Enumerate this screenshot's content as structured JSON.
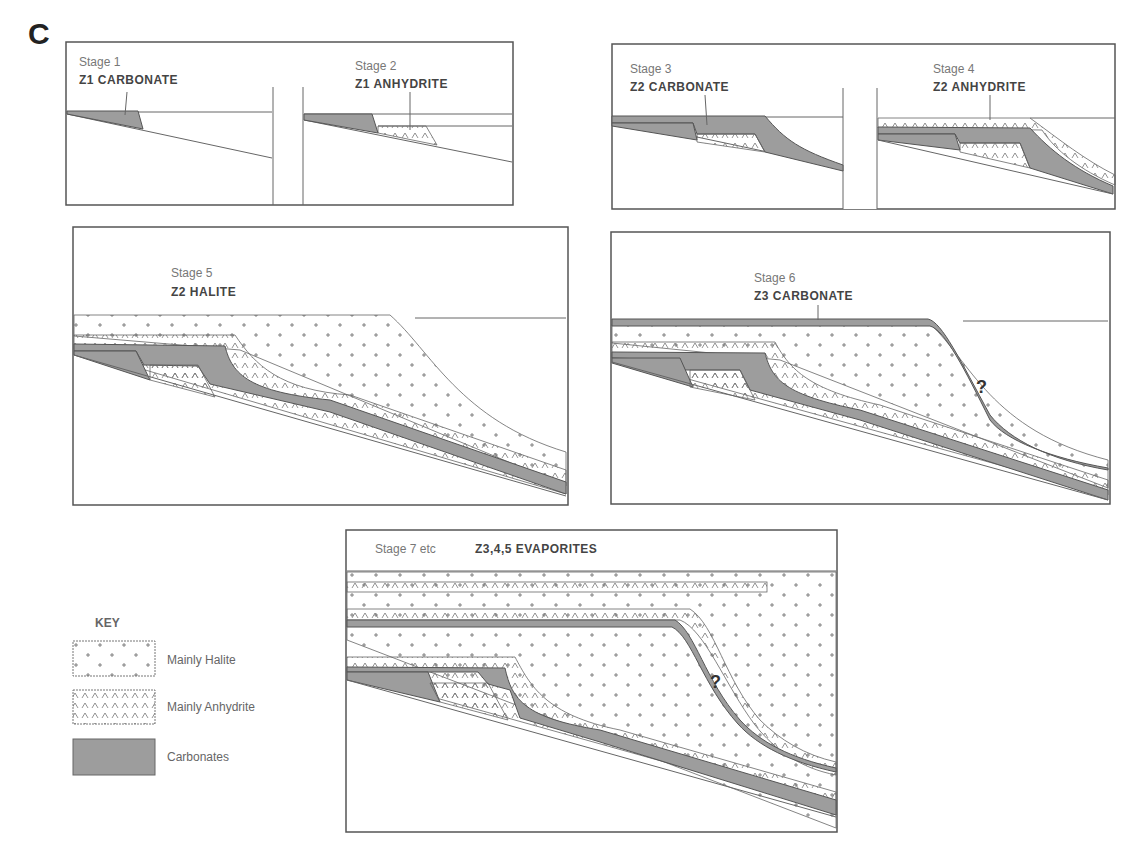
{
  "figure": {
    "panel_letter": "C",
    "colors": {
      "carbonate": "#9d9d9d",
      "line": "#555555",
      "background": "#ffffff"
    }
  },
  "stages": [
    {
      "label": "Stage 1",
      "title": "Z1  CARBONATE"
    },
    {
      "label": "Stage 2",
      "title": "Z1  ANHYDRITE"
    },
    {
      "label": "Stage 3",
      "title": "Z2  CARBONATE"
    },
    {
      "label": "Stage 4",
      "title": "Z2  ANHYDRITE"
    },
    {
      "label": "Stage 5",
      "title": "Z2  HALITE"
    },
    {
      "label": "Stage 6",
      "title": "Z3  CARBONATE"
    },
    {
      "label": "Stage 7 etc",
      "title": "Z3,4,5 EVAPORITES"
    }
  ],
  "key": {
    "title": "KEY",
    "items": [
      {
        "label": "Mainly Halite",
        "pattern": "plus-signs"
      },
      {
        "label": "Mainly Anhydrite",
        "pattern": "caret-signs"
      },
      {
        "label": "Carbonates",
        "pattern": "grey-fill"
      }
    ]
  },
  "annotations": {
    "question_mark": "?"
  }
}
